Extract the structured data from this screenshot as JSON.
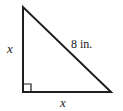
{
  "figure": {
    "shape": "right triangle",
    "stroke_color": "#1f1f1f",
    "background_color": "#ffffff",
    "labels": {
      "vertical_leg": "x",
      "horizontal_leg": "x",
      "hypotenuse": "8 in."
    },
    "right_angle_marker": "square",
    "vertices": {
      "apex": "23,7",
      "bottom_left": "23,92",
      "bottom_right": "111,92"
    }
  }
}
